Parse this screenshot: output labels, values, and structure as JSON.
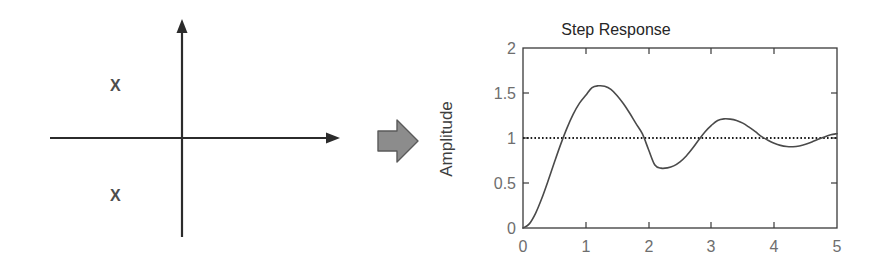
{
  "figure": {
    "background_color": "#ffffff",
    "ink_color": "#3a3a3a"
  },
  "pole_diagram": {
    "name": "s-plane pole plot",
    "axes": {
      "real_axis_label": "",
      "imag_axis_label": "",
      "origin_x": 182,
      "origin_y": 138,
      "color": "#2b2b2b"
    },
    "poles": [
      {
        "id": "pole-upper",
        "marker": "x",
        "label": "X",
        "x": 116,
        "y": 86
      },
      {
        "id": "pole-lower",
        "marker": "x",
        "label": "X",
        "x": 116,
        "y": 196
      }
    ],
    "marker_color": "#4d4d4d"
  },
  "transform_arrow": {
    "name": "right block arrow",
    "icon": "arrow-right-block-icon",
    "fill_color": "#8c8c8c",
    "stroke_color": "#5a5a5a"
  },
  "chart_data": {
    "type": "line",
    "title": "Step Response",
    "xlabel": "",
    "ylabel": "Amplitude",
    "xlim": [
      0,
      5
    ],
    "ylim": [
      0,
      2
    ],
    "xticks": [
      "0",
      "1",
      "2",
      "3",
      "4",
      "5"
    ],
    "yticks": [
      "0",
      "0.5",
      "1",
      "1.5",
      "2"
    ],
    "xtick_values": [
      0,
      1,
      2,
      3,
      4,
      5
    ],
    "ytick_values": [
      0,
      0.5,
      1,
      1.5,
      2
    ],
    "grid": false,
    "legend": null,
    "box": true,
    "line_color": "#4a4a4a",
    "reference_line": {
      "name": "steady-state reference",
      "value": 1,
      "style": "dotted",
      "color": "#1c1c1c"
    },
    "annotations": [
      {
        "label": "overshoot peak",
        "x": 1.07,
        "y": 1.6
      },
      {
        "label": "first undershoot",
        "x": 2.11,
        "y": 0.66
      },
      {
        "label": "second peak",
        "x": 3.07,
        "y": 1.21
      },
      {
        "label": "second undershoot",
        "x": 4.14,
        "y": 0.91
      }
    ],
    "series": [
      {
        "name": "step response",
        "x": [
          0.0,
          0.1,
          0.2,
          0.3,
          0.4,
          0.5,
          0.6,
          0.7,
          0.8,
          0.9,
          1.0,
          1.1,
          1.2,
          1.3,
          1.4,
          1.5,
          1.6,
          1.7,
          1.8,
          1.9,
          2.0,
          2.1,
          2.2,
          2.3,
          2.4,
          2.5,
          2.6,
          2.7,
          2.8,
          2.9,
          3.0,
          3.1,
          3.2,
          3.3,
          3.4,
          3.5,
          3.6,
          3.7,
          3.8,
          3.9,
          4.0,
          4.1,
          4.2,
          4.3,
          4.4,
          4.5,
          4.6,
          4.7,
          4.8,
          4.9,
          5.0
        ],
        "y": [
          0.0,
          0.046,
          0.163,
          0.33,
          0.525,
          0.73,
          0.929,
          1.11,
          1.265,
          1.387,
          1.474,
          1.56,
          1.58,
          1.575,
          1.54,
          1.47,
          1.38,
          1.275,
          1.16,
          1.048,
          0.87,
          0.7,
          0.665,
          0.668,
          0.69,
          0.735,
          0.8,
          0.885,
          0.98,
          1.07,
          1.14,
          1.195,
          1.213,
          1.21,
          1.195,
          1.165,
          1.12,
          1.07,
          1.015,
          0.975,
          0.942,
          0.918,
          0.905,
          0.903,
          0.912,
          0.93,
          0.955,
          0.985,
          1.012,
          1.035,
          1.048
        ]
      }
    ]
  }
}
